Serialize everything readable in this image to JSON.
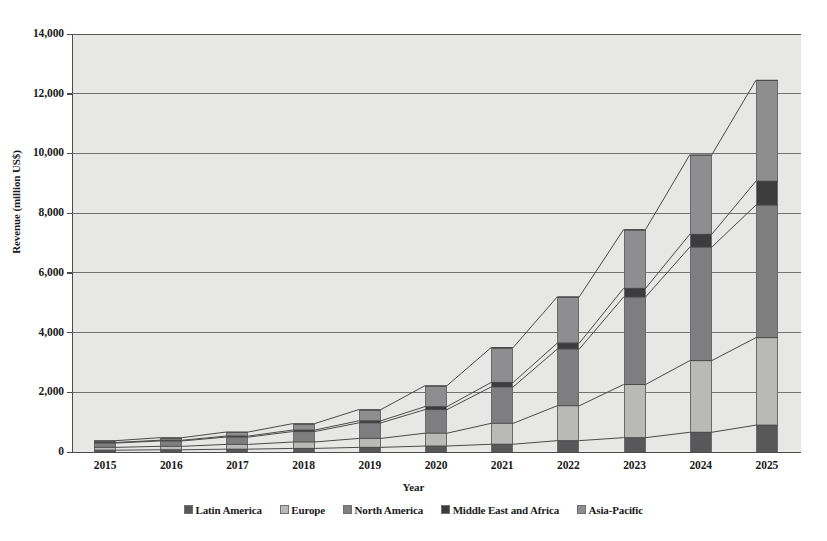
{
  "chart_data": {
    "type": "bar",
    "variant": "stacked-column-with-connector-lines",
    "title": "",
    "xlabel": "Year",
    "ylabel": "Revenue (million US$)",
    "categories": [
      "2015",
      "2016",
      "2017",
      "2018",
      "2019",
      "2020",
      "2021",
      "2022",
      "2023",
      "2024",
      "2025"
    ],
    "ylim": [
      0,
      14000
    ],
    "ytick_labels": [
      "0",
      "2,000",
      "4,000",
      "6,000",
      "8,000",
      "10,000",
      "12,000",
      "14,000"
    ],
    "ytick_values": [
      0,
      2000,
      4000,
      6000,
      8000,
      10000,
      12000,
      14000
    ],
    "grid": true,
    "legend_position": "bottom",
    "series": [
      {
        "name": "Latin America",
        "color": "#58585a",
        "values": [
          60,
          75,
          95,
          120,
          155,
          200,
          260,
          380,
          480,
          660,
          900
        ]
      },
      {
        "name": "Europe",
        "color": "#b9b9b8",
        "values": [
          95,
          115,
          160,
          215,
          300,
          430,
          700,
          1170,
          1780,
          2400,
          2930
        ]
      },
      {
        "name": "North America",
        "color": "#7e7e80",
        "values": [
          145,
          180,
          245,
          350,
          520,
          790,
          1220,
          1900,
          2930,
          3800,
          4440
        ]
      },
      {
        "name": "Middle East and Africa",
        "color": "#3c3c3e",
        "values": [
          20,
          25,
          35,
          50,
          70,
          100,
          150,
          200,
          290,
          430,
          800
        ]
      },
      {
        "name": "Asia-Pacific",
        "color": "#8e8e90",
        "values": [
          60,
          85,
          135,
          215,
          375,
          700,
          1170,
          1550,
          1970,
          2660,
          3380
        ]
      }
    ],
    "stack_totals": [
      380,
      480,
      670,
      950,
      1420,
      2220,
      3500,
      5200,
      7450,
      9950,
      12450
    ],
    "connector_lines": true
  },
  "legend": {
    "items": [
      {
        "label": "Latin America",
        "color": "#58585a"
      },
      {
        "label": "Europe",
        "color": "#b9b9b8"
      },
      {
        "label": "North America",
        "color": "#7e7e80"
      },
      {
        "label": "Middle East and Africa",
        "color": "#3c3c3e"
      },
      {
        "label": "Asia-Pacific",
        "color": "#8e8e90"
      }
    ]
  },
  "style": {
    "plot_background": "#e7e7e6",
    "gridline_color": "#5d5d5d",
    "axis_color": "#4a4a4a",
    "text_color": "#1a1a1a"
  }
}
